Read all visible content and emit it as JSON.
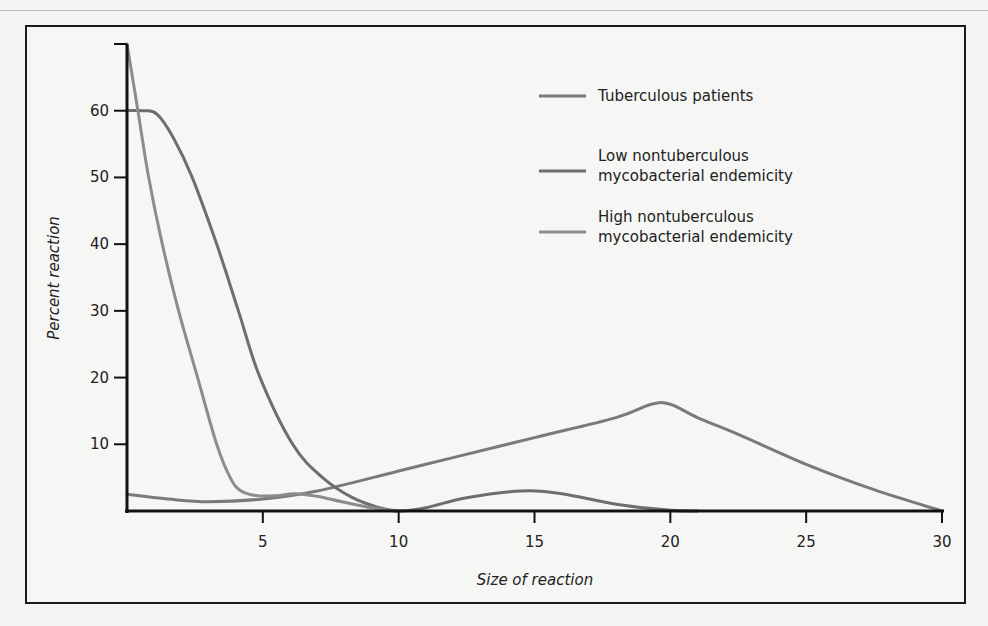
{
  "chart_data": {
    "type": "line",
    "title": "",
    "xlabel": "Size of reaction",
    "ylabel": "Percent reaction",
    "xlim": [
      0,
      30
    ],
    "ylim": [
      0,
      70
    ],
    "xticks": [
      5,
      10,
      15,
      20,
      25,
      30
    ],
    "yticks": [
      10,
      20,
      30,
      40,
      50,
      60,
      70
    ],
    "ytick_labels": [
      "10",
      "20",
      "30",
      "40",
      "50",
      "60",
      ""
    ],
    "grid": false,
    "legend_position": "upper right",
    "series": [
      {
        "name": "Tuberculous patients",
        "color": "#7a7a7a",
        "x": [
          0,
          1.5,
          3,
          5,
          7,
          10,
          12,
          15,
          18,
          19.3,
          20,
          21,
          22.5,
          25,
          27.5,
          30
        ],
        "values": [
          2.5,
          1.8,
          1.4,
          1.8,
          3,
          6,
          8,
          11,
          14,
          16,
          16,
          14,
          11.5,
          7,
          3.2,
          0
        ]
      },
      {
        "name": "Low nontuberculous mycobacterial endemicity",
        "color": "#6e6e6e",
        "x": [
          0,
          0.6,
          1.1,
          1.7,
          2.4,
          3.3,
          4.1,
          4.9,
          6.1,
          7.2,
          8.3,
          9.3,
          10,
          11,
          12.5,
          14.5,
          16,
          18,
          20,
          21
        ],
        "values": [
          60,
          60,
          59.5,
          56,
          50,
          40,
          30,
          20,
          10,
          5,
          2,
          0.5,
          0,
          0.5,
          2,
          3,
          2.6,
          1,
          0.1,
          0
        ]
      },
      {
        "name": "High nontuberculous mycobacterial endemicity",
        "color": "#8c8c8c",
        "x": [
          0,
          0.4,
          0.8,
          1.3,
          1.9,
          2.6,
          3.3,
          3.8,
          4.2,
          4.8,
          5.5,
          6.2,
          7,
          8,
          9,
          10
        ],
        "values": [
          70,
          60,
          50,
          40,
          30,
          20,
          10,
          5,
          3,
          2.3,
          2.3,
          2.6,
          2.2,
          1.3,
          0.5,
          0
        ]
      }
    ]
  },
  "legend": [
    {
      "lines": [
        "Tuberculous patients"
      ],
      "color": "#7a7a7a"
    },
    {
      "lines": [
        "Low nontuberculous",
        "mycobacterial endemicity"
      ],
      "color": "#6e6e6e"
    },
    {
      "lines": [
        "High nontuberculous",
        "mycobacterial endemicity"
      ],
      "color": "#8c8c8c"
    }
  ]
}
